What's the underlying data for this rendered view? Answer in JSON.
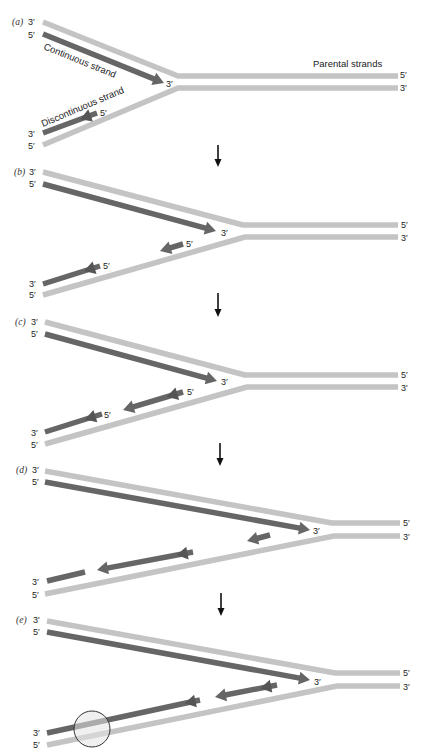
{
  "figure": {
    "colors": {
      "parental_strand": "#c4c4c4",
      "new_strand": "#666666",
      "new_strand_dark": "#555555",
      "highlight_fill": "#e4e4e4",
      "highlight_stroke": "#333333"
    },
    "annotations": {
      "continuous": "Continuous strand",
      "discontinuous": "Discontinuous strand",
      "parental": "Parental strands"
    },
    "panels": [
      {
        "label": "(a)",
        "left": {
          "parental_top": "3′",
          "leading": "5′",
          "lagging": "3′",
          "parental_bottom": "5′"
        },
        "right": {
          "parental_top": "5′",
          "parental_bottom": "3′"
        },
        "leading_tip": "3′",
        "fragment_ends": [
          "5′"
        ]
      },
      {
        "label": "(b)",
        "left": {
          "parental_top": "3′",
          "leading": "5′",
          "lagging": "3′",
          "parental_bottom": "5′"
        },
        "right": {
          "parental_top": "5′",
          "parental_bottom": "3′"
        },
        "leading_tip": "3′",
        "fragment_ends": [
          "5′",
          "5′"
        ]
      },
      {
        "label": "(c)",
        "left": {
          "parental_top": "3′",
          "leading": "5′",
          "lagging": "3′",
          "parental_bottom": "5′"
        },
        "right": {
          "parental_top": "5′",
          "parental_bottom": "3′"
        },
        "leading_tip": "3′",
        "fragment_ends": [
          "5′",
          "5′"
        ]
      },
      {
        "label": "(d)",
        "left": {
          "parental_top": "3′",
          "leading": "5′",
          "lagging": "3′",
          "parental_bottom": "5′"
        },
        "right": {
          "parental_top": "5′",
          "parental_bottom": "3′"
        },
        "leading_tip": "3′",
        "fragment_ends": []
      },
      {
        "label": "(e)",
        "left": {
          "parental_top": "3′",
          "leading": "5′",
          "lagging": "3′",
          "parental_bottom": "5′"
        },
        "right": {
          "parental_top": "5′",
          "parental_bottom": "3′"
        },
        "leading_tip": "3′",
        "fragment_ends": []
      }
    ]
  }
}
